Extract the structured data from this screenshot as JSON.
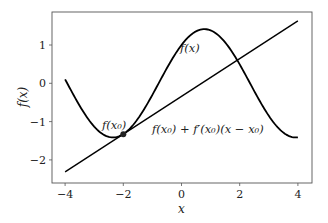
{
  "chart_data": {
    "type": "line",
    "title": "",
    "xlabel": "x",
    "ylabel": "f(x)",
    "xlim": [
      -4.45,
      4.5
    ],
    "ylim": [
      -2.6,
      1.85
    ],
    "xticks": [
      -4,
      -2,
      0,
      2,
      4
    ],
    "xtick_labels": [
      "−4",
      "−2",
      "0",
      "2",
      "4"
    ],
    "yticks": [
      -2,
      -1,
      0,
      1
    ],
    "ytick_labels": [
      "−2",
      "−1",
      "0",
      "1"
    ],
    "grid": false,
    "legend": null,
    "series": [
      {
        "name": "f(x)",
        "expression": "sin(x) + cos(x)",
        "color": "#000000",
        "x": [
          -4,
          -3.5,
          -3,
          -2.5,
          -2,
          -1.5,
          -1,
          -0.5,
          0,
          0.5,
          1,
          1.5,
          2,
          2.5,
          3,
          3.5,
          4
        ],
        "values": [
          0.1,
          -0.59,
          -1.13,
          -1.4,
          -1.33,
          -0.93,
          -0.3,
          0.4,
          1.0,
          1.36,
          1.38,
          1.07,
          0.49,
          -0.2,
          -0.85,
          -1.29,
          -1.41
        ]
      },
      {
        "name": "f(x0) + f'(x0)(x − x0)",
        "expression": "tangent line at x0 = -2",
        "color": "#000000",
        "x": [
          -4,
          4
        ],
        "values": [
          -2.31,
          1.63
        ]
      }
    ],
    "points": [
      {
        "name": "f(x0)",
        "x": -2,
        "y": -1.33
      }
    ],
    "annotations": [
      {
        "text": "f(x)",
        "x": 0.0,
        "y": 0.85
      },
      {
        "text": "f(x₀)",
        "x": -2.65,
        "y": -0.95
      },
      {
        "text": "f(x₀) + f′(x₀)(x − x₀)",
        "x": -1.0,
        "y": -1.05
      }
    ]
  },
  "labels": {
    "xlabel": "x",
    "ylabel": "f(x)",
    "annot_fx": "f(x)",
    "annot_fx0": "f(x₀)",
    "annot_tangent": "f(x₀) + f′(x₀)(x − x₀)",
    "xticks": [
      "−4",
      "−2",
      "0",
      "2",
      "4"
    ],
    "yticks": [
      "1",
      "0",
      "−1",
      "−2"
    ]
  }
}
